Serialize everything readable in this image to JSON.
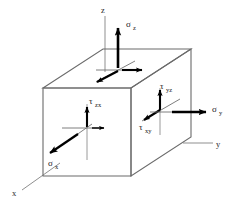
{
  "figure": {
    "background_color": "#ffffff",
    "box_edge_color": "#6b6b6b",
    "arrow_color": "#000000",
    "axis_color": "#8a8a8a",
    "label_color": "#1a1a1a"
  },
  "axes": [
    {
      "id": "z",
      "label": "z",
      "symbol": "z",
      "direction": "up"
    },
    {
      "id": "y",
      "label": "y",
      "symbol": "y",
      "direction": "right"
    },
    {
      "id": "x",
      "label": "x",
      "symbol": "x",
      "direction": "down-left"
    }
  ],
  "stresses": [
    {
      "id": "sigma-z",
      "base": "σ",
      "subscript": "z",
      "label": "σz",
      "type": "normal",
      "face": "top",
      "direction": "up"
    },
    {
      "id": "sigma-y",
      "base": "σ",
      "subscript": "y",
      "label": "σy",
      "type": "normal",
      "face": "right",
      "direction": "right"
    },
    {
      "id": "sigma-x",
      "base": "σ",
      "subscript": "x",
      "label": "σx",
      "type": "normal",
      "face": "front-left",
      "direction": "down-left"
    },
    {
      "id": "tau-zx",
      "base": "τ",
      "subscript": "zx",
      "label": "τzx",
      "type": "shear",
      "face": "front-left",
      "direction": "up"
    },
    {
      "id": "tau-yz",
      "base": "τ",
      "subscript": "yz",
      "label": "τyz",
      "type": "shear",
      "face": "right",
      "direction": "up"
    },
    {
      "id": "tau-xy",
      "base": "τ",
      "subscript": "xy",
      "label": "τxy",
      "type": "shear",
      "face": "right",
      "direction": "down-left"
    }
  ]
}
